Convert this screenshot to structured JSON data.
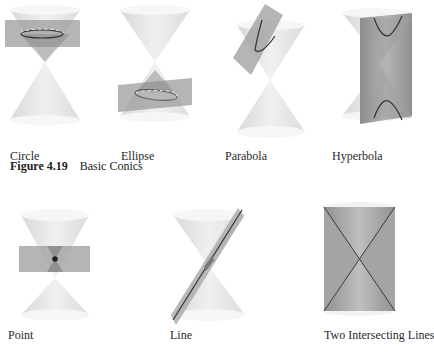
{
  "figure": {
    "number": "Figure 4.19",
    "title": "Basic Conics"
  },
  "panels": [
    {
      "id": "circle",
      "label": "Circle"
    },
    {
      "id": "ellipse",
      "label": "Ellipse"
    },
    {
      "id": "parabola",
      "label": "Parabola"
    },
    {
      "id": "hyperbola",
      "label": "Hyperbola"
    },
    {
      "id": "point",
      "label": "Point"
    },
    {
      "id": "line",
      "label": "Line"
    },
    {
      "id": "two-lines",
      "label": "Two Intersecting Lines"
    }
  ],
  "colors": {
    "cone_fill": "#e6e6e6",
    "cone_rim": "#f2f2f2",
    "plane": "#9a9a9a",
    "curve": "#333333"
  }
}
